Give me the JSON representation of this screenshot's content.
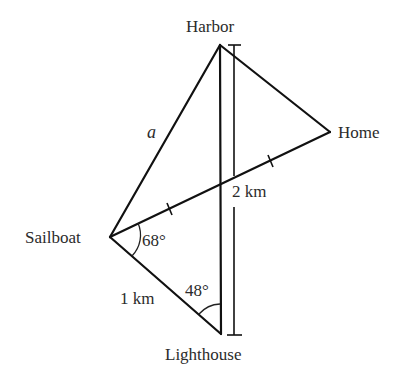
{
  "diagram": {
    "type": "geometry-figure",
    "points": {
      "harbor": {
        "label": "Harbor",
        "x": 220,
        "y": 45
      },
      "home": {
        "label": "Home",
        "x": 330,
        "y": 132
      },
      "sailboat": {
        "label": "Sailboat",
        "x": 110,
        "y": 237
      },
      "lighthouse": {
        "label": "Lighthouse",
        "x": 221,
        "y": 334
      }
    },
    "segments": [
      {
        "from": "sailboat",
        "to": "harbor",
        "label": "a"
      },
      {
        "from": "harbor",
        "to": "home",
        "label": ""
      },
      {
        "from": "sailboat",
        "to": "home",
        "label": "",
        "tick_marks": 2
      },
      {
        "from": "harbor",
        "to": "lighthouse",
        "label": ""
      },
      {
        "from": "sailboat",
        "to": "lighthouse",
        "label": "1 km"
      }
    ],
    "dimension_line": {
      "from": "harbor",
      "to": "lighthouse",
      "label": "2 km"
    },
    "angles": [
      {
        "vertex": "sailboat",
        "label": "68°"
      },
      {
        "vertex": "lighthouse",
        "label": "48°"
      }
    ],
    "labels": {
      "harbor": "Harbor",
      "home": "Home",
      "sailboat": "Sailboat",
      "lighthouse": "Lighthouse",
      "side_a": "a",
      "side_1km": "1 km",
      "side_2km": "2 km",
      "angle_sailboat": "68°",
      "angle_lighthouse": "48°"
    }
  }
}
